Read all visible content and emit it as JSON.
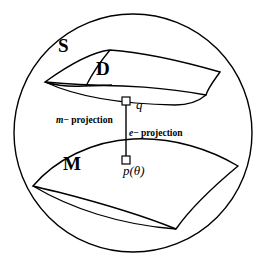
{
  "figure": {
    "labels": {
      "ambient_space": "S",
      "submanifold_d": "D",
      "model_manifold_m": "M",
      "point_q": "q",
      "point_p_theta": "p(θ)",
      "m_projection_symbol": "m",
      "m_projection_text": "− projection",
      "e_projection_symbol": "e",
      "e_projection_text": "− projection"
    },
    "colors": {
      "stroke": "#000000",
      "background": "#ffffff"
    },
    "geometry": {
      "circle": {
        "cx": 133,
        "cy": 133,
        "r": 119
      },
      "q_marker": {
        "x": 126,
        "y": 103
      },
      "p_marker": {
        "x": 126,
        "y": 160
      },
      "connector": {
        "x1": 126,
        "y1": 103,
        "x2": 126,
        "y2": 160
      }
    }
  }
}
